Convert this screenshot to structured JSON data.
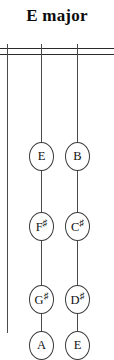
{
  "title": "E major",
  "diagram": {
    "type": "string-fingerboard",
    "nut_lines": 2,
    "strings": [
      {
        "name": "string-left",
        "x": 7
      },
      {
        "name": "string-middle",
        "x": 41
      },
      {
        "name": "string-right",
        "x": 77
      }
    ],
    "notes": [
      {
        "label": "E",
        "root": "E",
        "accidental": "",
        "string": 2,
        "y": 98,
        "x": 41
      },
      {
        "label": "B",
        "root": "B",
        "accidental": "",
        "string": 3,
        "y": 98,
        "x": 77
      },
      {
        "label": "F#",
        "root": "F",
        "accidental": "#",
        "string": 2,
        "y": 168,
        "x": 41
      },
      {
        "label": "C#",
        "root": "C",
        "accidental": "#",
        "string": 3,
        "y": 168,
        "x": 77
      },
      {
        "label": "G#",
        "root": "G",
        "accidental": "#",
        "string": 2,
        "y": 241,
        "x": 41
      },
      {
        "label": "D#",
        "root": "D",
        "accidental": "#",
        "string": 3,
        "y": 241,
        "x": 77
      },
      {
        "label": "A",
        "root": "A",
        "accidental": "",
        "string": 2,
        "y": 287,
        "x": 41
      },
      {
        "label": "E",
        "root": "E",
        "accidental": "",
        "string": 3,
        "y": 287,
        "x": 77
      }
    ]
  },
  "colors": {
    "background": "#ffffff",
    "ink": "#2a2a2a",
    "string": "#4a4a4a",
    "note_outline": "#3a3a3a",
    "text": "#111111"
  }
}
